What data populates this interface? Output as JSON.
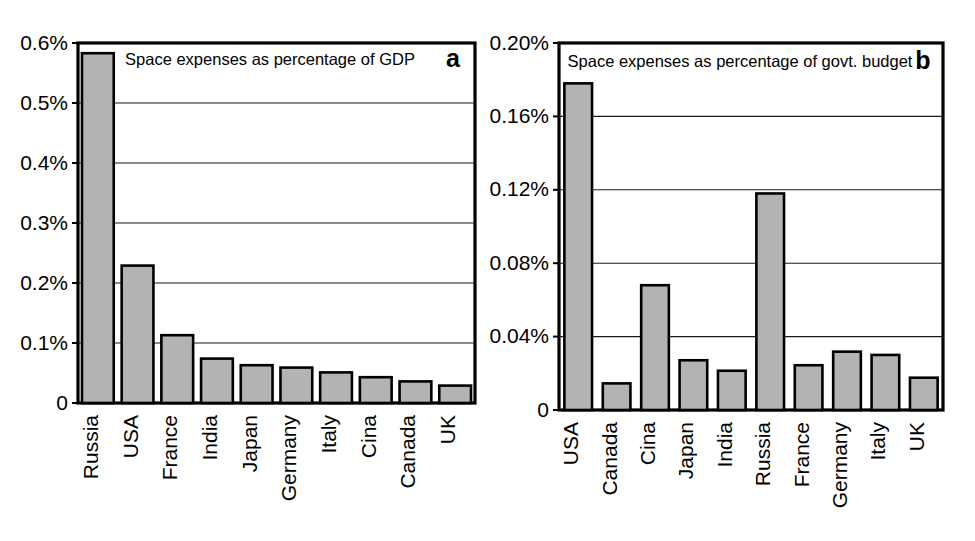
{
  "figure": {
    "background_color": "#ffffff",
    "bar_fill_color": "#b3b3b3",
    "bar_stroke_color": "#000000"
  },
  "chart_data": [
    {
      "type": "bar",
      "panel": "a",
      "panel_label": "a",
      "title": "Space expenses as percentage of GDP",
      "xlabel": "",
      "ylabel": "",
      "categories": [
        "Russia",
        "USA",
        "France",
        "India",
        "Japan",
        "Germany",
        "Italy",
        "Cina",
        "Canada",
        "UK"
      ],
      "values": [
        0.583,
        0.229,
        0.113,
        0.074,
        0.063,
        0.059,
        0.051,
        0.043,
        0.036,
        0.029
      ],
      "value_unit": "%",
      "ylim": [
        0,
        0.6
      ],
      "yticks": [
        0,
        0.1,
        0.2,
        0.3,
        0.4,
        0.5,
        0.6
      ],
      "ytick_labels": [
        "0",
        "0.1%",
        "0.2%",
        "0.3%",
        "0.4%",
        "0.5%",
        "0.6%"
      ],
      "grid": true,
      "legend": "none"
    },
    {
      "type": "bar",
      "panel": "b",
      "panel_label": "b",
      "title": "Space expenses as percentage of govt. budget",
      "xlabel": "",
      "ylabel": "",
      "categories": [
        "USA",
        "Canada",
        "Cina",
        "Japan",
        "India",
        "Russia",
        "France",
        "Germany",
        "Italy",
        "UK"
      ],
      "values": [
        0.178,
        0.0145,
        0.068,
        0.0271,
        0.0214,
        0.118,
        0.0244,
        0.0318,
        0.03,
        0.0176
      ],
      "value_unit": "%",
      "ylim": [
        0,
        0.2
      ],
      "yticks": [
        0,
        0.04,
        0.08,
        0.12,
        0.16,
        0.2
      ],
      "ytick_labels": [
        "0",
        "0.04%",
        "0.08%",
        "0.12%",
        "0.16%",
        "0.20%"
      ],
      "grid": true,
      "legend": "none"
    }
  ]
}
